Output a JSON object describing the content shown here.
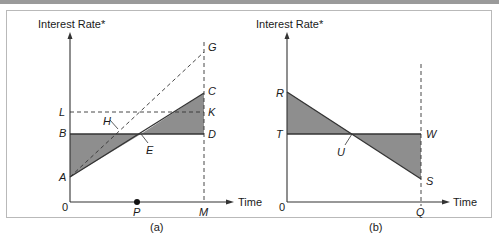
{
  "figure": {
    "panel_a": {
      "y_axis_label": "Interest Rate*",
      "x_axis_label": "Time",
      "caption": "(a)",
      "origin_label": "0",
      "points": {
        "A": "A",
        "B": "B",
        "C": "C",
        "D": "D",
        "E": "E",
        "G": "G",
        "H": "H",
        "K": "K",
        "L": "L",
        "M": "M",
        "P": "P"
      }
    },
    "panel_b": {
      "y_axis_label": "Interest Rate*",
      "x_axis_label": "Time",
      "caption": "(b)",
      "origin_label": "0",
      "points": {
        "R": "R",
        "S": "S",
        "T": "T",
        "U": "U",
        "W": "W",
        "Q": "Q"
      }
    },
    "colors": {
      "shade": "#8e8e8e",
      "line": "#333333",
      "frame": "#b9b9b9",
      "topbar": "#9a9a9a"
    }
  }
}
